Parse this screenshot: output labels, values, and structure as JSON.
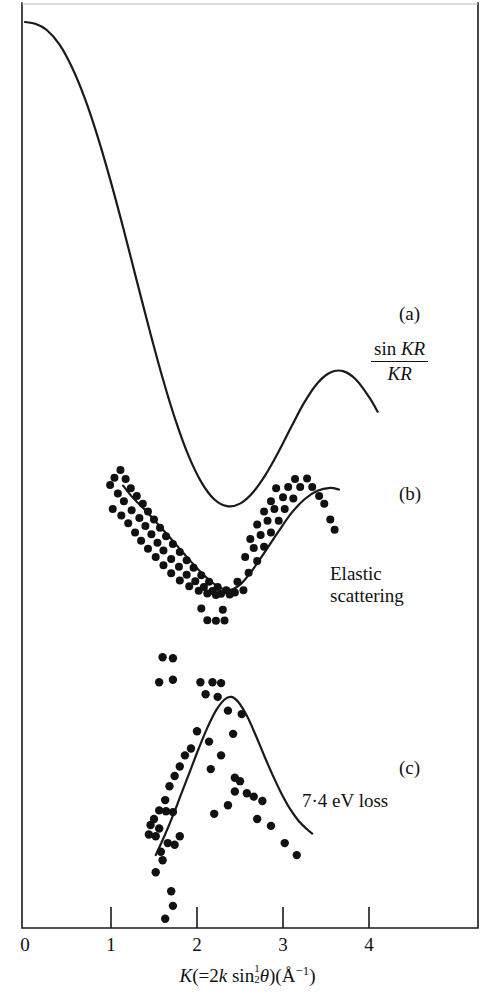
{
  "figure": {
    "background_color": "#ffffff",
    "ink_color": "#111111",
    "width": 495,
    "height": 1004
  },
  "axis": {
    "title_prefix": "K",
    "title_open": "(=2",
    "title_k": "k",
    "title_sin": " sin",
    "title_half_num": "1",
    "title_half_den": "2",
    "title_theta": "θ",
    "title_close": ")(Å",
    "title_exp": "−1",
    "title_end": ")",
    "title_plain": "K(=2k sin½θ)(Å⁻¹)",
    "tick_labels": [
      "0",
      "1",
      "2",
      "3",
      "4"
    ],
    "tick_values": [
      0,
      1,
      2,
      3,
      4
    ],
    "range": [
      0,
      5.28
    ]
  },
  "panels": {
    "a": {
      "tag": "(a)",
      "formula_numerator_sin": "sin",
      "formula_numerator_arg": "KR",
      "formula_denominator": "KR",
      "formula_plain": "sin KR / KR"
    },
    "b": {
      "tag": "(b)",
      "caption_line1": "Elastic",
      "caption_line2": "scattering",
      "caption_plain": "Elastic scattering"
    },
    "c": {
      "tag": "(c)",
      "caption": "7·4 eV loss"
    }
  },
  "chart_data": {
    "type": "line",
    "title": "",
    "xlabel": "K(=2k sin½θ)(Å⁻¹)",
    "ylabel": "",
    "xlim": [
      0,
      5.28
    ],
    "grid": false,
    "legend": "none",
    "series": [
      {
        "name": "sin KR / KR",
        "panel": "a",
        "type": "line",
        "points": [
          [
            0.0,
            1.0
          ],
          [
            0.12,
            0.996
          ],
          [
            0.25,
            0.982
          ],
          [
            0.4,
            0.948
          ],
          [
            0.55,
            0.893
          ],
          [
            0.7,
            0.82
          ],
          [
            0.85,
            0.73
          ],
          [
            1.0,
            0.627
          ],
          [
            1.15,
            0.515
          ],
          [
            1.3,
            0.398
          ],
          [
            1.45,
            0.282
          ],
          [
            1.6,
            0.172
          ],
          [
            1.75,
            0.074
          ],
          [
            1.9,
            -0.008
          ],
          [
            2.05,
            -0.07
          ],
          [
            2.2,
            -0.11
          ],
          [
            2.35,
            -0.126
          ],
          [
            2.5,
            -0.12
          ],
          [
            2.65,
            -0.094
          ],
          [
            2.8,
            -0.052
          ],
          [
            2.95,
            0.001
          ],
          [
            3.1,
            0.06
          ],
          [
            3.25,
            0.116
          ],
          [
            3.4,
            0.16
          ],
          [
            3.55,
            0.185
          ],
          [
            3.7,
            0.188
          ],
          [
            3.85,
            0.168
          ],
          [
            4.0,
            0.128
          ],
          [
            4.1,
            0.094
          ]
        ]
      },
      {
        "name": "Elastic scattering fit",
        "panel": "b",
        "type": "line",
        "points": [
          [
            1.14,
            0.88
          ],
          [
            1.25,
            0.79
          ],
          [
            1.4,
            0.69
          ],
          [
            1.55,
            0.58
          ],
          [
            1.7,
            0.47
          ],
          [
            1.85,
            0.355
          ],
          [
            2.0,
            0.245
          ],
          [
            2.15,
            0.15
          ],
          [
            2.28,
            0.09
          ],
          [
            2.4,
            0.08
          ],
          [
            2.52,
            0.13
          ],
          [
            2.65,
            0.235
          ],
          [
            2.8,
            0.38
          ],
          [
            2.95,
            0.53
          ],
          [
            3.1,
            0.67
          ],
          [
            3.25,
            0.775
          ],
          [
            3.4,
            0.84
          ],
          [
            3.55,
            0.862
          ],
          [
            3.65,
            0.85
          ]
        ]
      },
      {
        "name": "Elastic scattering data",
        "panel": "b",
        "type": "scatter",
        "points": [
          [
            1.11,
            1.0
          ],
          [
            1.04,
            0.94
          ],
          [
            1.17,
            0.93
          ],
          [
            0.99,
            0.885
          ],
          [
            1.23,
            0.86
          ],
          [
            1.08,
            0.82
          ],
          [
            1.3,
            0.8
          ],
          [
            1.15,
            0.76
          ],
          [
            1.37,
            0.74
          ],
          [
            1.02,
            0.7
          ],
          [
            1.24,
            0.69
          ],
          [
            1.43,
            0.68
          ],
          [
            1.12,
            0.65
          ],
          [
            1.33,
            0.63
          ],
          [
            1.5,
            0.62
          ],
          [
            1.2,
            0.59
          ],
          [
            1.4,
            0.57
          ],
          [
            1.57,
            0.555
          ],
          [
            1.28,
            0.52
          ],
          [
            1.47,
            0.505
          ],
          [
            1.64,
            0.49
          ],
          [
            1.35,
            0.455
          ],
          [
            1.54,
            0.44
          ],
          [
            1.72,
            0.43
          ],
          [
            1.43,
            0.395
          ],
          [
            1.61,
            0.38
          ],
          [
            1.8,
            0.37
          ],
          [
            1.52,
            0.33
          ],
          [
            1.7,
            0.315
          ],
          [
            1.88,
            0.305
          ],
          [
            1.61,
            0.268
          ],
          [
            1.79,
            0.255
          ],
          [
            1.96,
            0.248
          ],
          [
            1.7,
            0.205
          ],
          [
            1.88,
            0.195
          ],
          [
            2.05,
            0.19
          ],
          [
            1.8,
            0.15
          ],
          [
            1.98,
            0.145
          ],
          [
            2.14,
            0.14
          ],
          [
            1.91,
            0.105
          ],
          [
            2.08,
            0.1
          ],
          [
            2.24,
            0.1
          ],
          [
            2.02,
            0.072
          ],
          [
            2.18,
            0.07
          ],
          [
            2.34,
            0.075
          ],
          [
            2.12,
            0.05
          ],
          [
            2.28,
            0.048
          ],
          [
            2.44,
            0.058
          ],
          [
            2.22,
            0.038
          ],
          [
            2.38,
            0.042
          ],
          [
            2.54,
            0.075
          ],
          [
            2.47,
            0.14
          ],
          [
            2.6,
            0.21
          ],
          [
            2.7,
            0.3
          ],
          [
            2.56,
            0.33
          ],
          [
            2.66,
            0.4
          ],
          [
            2.78,
            0.41
          ],
          [
            2.62,
            0.47
          ],
          [
            2.74,
            0.5
          ],
          [
            2.86,
            0.52
          ],
          [
            2.7,
            0.58
          ],
          [
            2.82,
            0.61
          ],
          [
            2.95,
            0.61
          ],
          [
            2.78,
            0.68
          ],
          [
            2.9,
            0.7
          ],
          [
            3.02,
            0.7
          ],
          [
            2.86,
            0.76
          ],
          [
            3.0,
            0.79
          ],
          [
            3.12,
            0.78
          ],
          [
            2.92,
            0.86
          ],
          [
            3.06,
            0.87
          ],
          [
            3.2,
            0.87
          ],
          [
            3.14,
            0.93
          ],
          [
            3.28,
            0.935
          ],
          [
            3.34,
            0.87
          ],
          [
            3.42,
            0.8
          ],
          [
            3.48,
            0.74
          ],
          [
            2.05,
            -0.065
          ],
          [
            2.3,
            -0.075
          ],
          [
            2.12,
            -0.155
          ],
          [
            2.22,
            -0.16
          ],
          [
            2.32,
            -0.158
          ],
          [
            3.55,
            0.62
          ],
          [
            3.6,
            0.54
          ]
        ]
      },
      {
        "name": "7·4 eV loss fit",
        "panel": "c",
        "type": "line",
        "points": [
          [
            1.52,
            0.04
          ],
          [
            1.62,
            0.15
          ],
          [
            1.72,
            0.27
          ],
          [
            1.82,
            0.4
          ],
          [
            1.92,
            0.53
          ],
          [
            2.02,
            0.66
          ],
          [
            2.12,
            0.78
          ],
          [
            2.22,
            0.88
          ],
          [
            2.32,
            0.945
          ],
          [
            2.4,
            0.96
          ],
          [
            2.48,
            0.93
          ],
          [
            2.58,
            0.85
          ],
          [
            2.68,
            0.74
          ],
          [
            2.78,
            0.62
          ],
          [
            2.88,
            0.505
          ],
          [
            2.98,
            0.4
          ],
          [
            3.08,
            0.31
          ],
          [
            3.18,
            0.24
          ],
          [
            3.28,
            0.19
          ],
          [
            3.34,
            0.165
          ]
        ]
      },
      {
        "name": "7·4 eV loss data",
        "panel": "c",
        "type": "scatter",
        "points": [
          [
            1.6,
            1.19
          ],
          [
            1.72,
            1.185
          ],
          [
            1.56,
            1.045
          ],
          [
            1.72,
            1.06
          ],
          [
            2.04,
            1.045
          ],
          [
            2.18,
            1.045
          ],
          [
            2.28,
            1.04
          ],
          [
            2.1,
            0.975
          ],
          [
            2.24,
            0.96
          ],
          [
            2.36,
            0.88
          ],
          [
            2.52,
            0.86
          ],
          [
            2.0,
            0.76
          ],
          [
            2.42,
            0.745
          ],
          [
            2.14,
            0.7
          ],
          [
            1.93,
            0.66
          ],
          [
            1.86,
            0.62
          ],
          [
            2.28,
            0.62
          ],
          [
            1.8,
            0.555
          ],
          [
            2.16,
            0.54
          ],
          [
            1.74,
            0.5
          ],
          [
            2.44,
            0.49
          ],
          [
            2.5,
            0.47
          ],
          [
            1.68,
            0.44
          ],
          [
            2.44,
            0.41
          ],
          [
            2.58,
            0.4
          ],
          [
            2.66,
            0.38
          ],
          [
            1.63,
            0.36
          ],
          [
            2.76,
            0.355
          ],
          [
            2.36,
            0.33
          ],
          [
            1.56,
            0.3
          ],
          [
            1.64,
            0.295
          ],
          [
            1.72,
            0.29
          ],
          [
            2.2,
            0.28
          ],
          [
            2.7,
            0.25
          ],
          [
            1.5,
            0.25
          ],
          [
            1.46,
            0.215
          ],
          [
            1.56,
            0.195
          ],
          [
            2.86,
            0.21
          ],
          [
            1.44,
            0.16
          ],
          [
            1.52,
            0.15
          ],
          [
            1.8,
            0.15
          ],
          [
            1.66,
            0.11
          ],
          [
            1.74,
            0.1
          ],
          [
            3.02,
            0.11
          ],
          [
            1.58,
            0.06
          ],
          [
            1.6,
            0.01
          ],
          [
            3.16,
            0.04
          ],
          [
            1.52,
            -0.06
          ],
          [
            1.7,
            -0.17
          ],
          [
            1.72,
            -0.255
          ],
          [
            1.63,
            -0.33
          ]
        ]
      }
    ]
  }
}
